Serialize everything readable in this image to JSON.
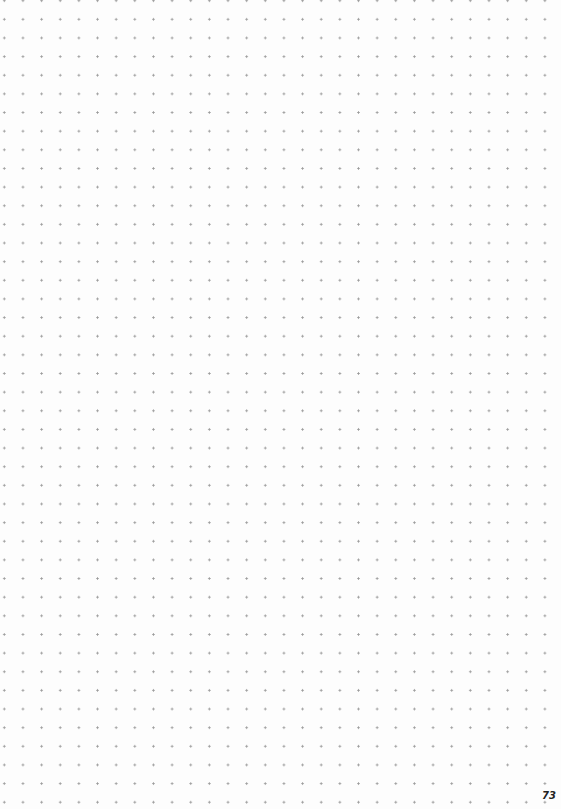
{
  "page": {
    "type": "dot-grid notebook page",
    "dot_color": "#9a9a9a",
    "background_color": "#fdfdfd",
    "grid_spacing_px": 18.65,
    "page_number": "73"
  }
}
